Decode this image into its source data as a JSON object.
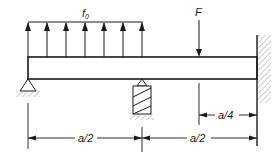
{
  "diagram": {
    "type": "beam-loading-diagram",
    "colors": {
      "line": "#1a1a1a",
      "hatch": "#9a9a9a",
      "background": "#ffffff"
    },
    "labels": {
      "distributed_load": "f",
      "distributed_load_sub": "0",
      "point_force": "F",
      "dim_left": "a/2",
      "dim_right": "a/2",
      "dim_force": "a/4"
    },
    "elements": {
      "beam": "horizontal beam",
      "left_support": "pin support",
      "middle_support": "spring support",
      "right_support": "fixed wall",
      "distributed_arrow_count": 7
    }
  }
}
